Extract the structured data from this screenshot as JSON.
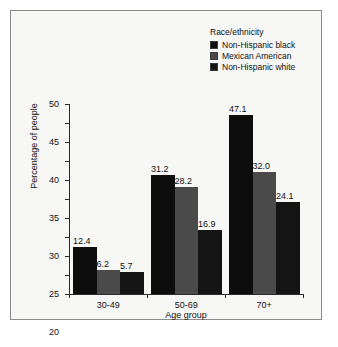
{
  "chart_data": {
    "type": "bar",
    "title": "",
    "xlabel": "Age group",
    "ylabel": "Percentage of people",
    "categories": [
      "30-49",
      "50-69",
      "70+"
    ],
    "series": [
      {
        "name": "Non-Hispanic black",
        "values": [
          12.4,
          31.2,
          47.1
        ],
        "color": "#0d0d0d"
      },
      {
        "name": "Mexican American",
        "values": [
          6.2,
          28.2,
          32.0
        ],
        "color": "#4a4a4a"
      },
      {
        "name": "Non-Hispanic white",
        "values": [
          5.7,
          16.9,
          24.1
        ],
        "color": "#141414"
      }
    ],
    "value_labels": [
      [
        "12.4",
        "6.2",
        "5.7"
      ],
      [
        "31.2",
        "28.2",
        "16.9"
      ],
      [
        "47.1",
        "32.0",
        "24.1"
      ]
    ],
    "ylim": [
      0,
      50
    ],
    "yticks": [
      0,
      5,
      10,
      15,
      20,
      25,
      30,
      35,
      40,
      45,
      50
    ],
    "ytick_labels": [
      "0",
      "5",
      "10",
      "15",
      "20",
      "25",
      "30",
      "35",
      "40",
      "45",
      "50"
    ],
    "grid": false,
    "legend_position": "top-right",
    "legend_title": "Race/ethnicity"
  },
  "legend": {
    "title": "Race/ethnicity",
    "entries": [
      {
        "label": "Non-Hispanic black",
        "color": "#0d0d0d"
      },
      {
        "label": "Mexican American",
        "color": "#4a4a4a"
      },
      {
        "label": "Non-Hispanic white",
        "color": "#141414"
      }
    ]
  },
  "colors": {
    "background": "#f7f7f5",
    "frame": "#8a8a8a",
    "axis": "#2b2b2b",
    "text": "#111111"
  }
}
